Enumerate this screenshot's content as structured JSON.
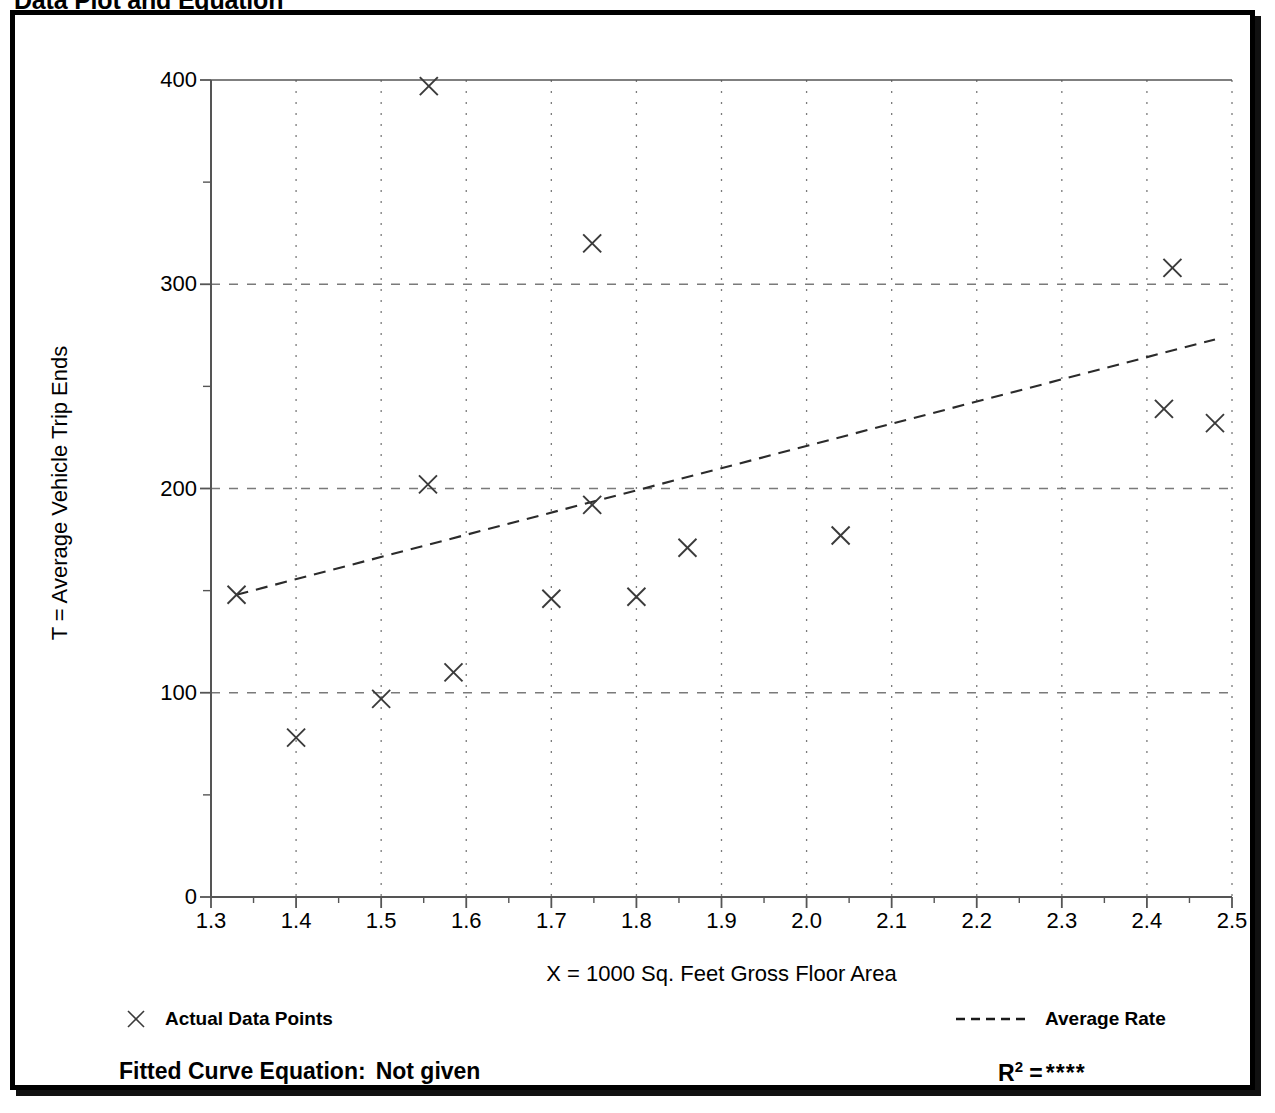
{
  "page_title": "Data Plot and Equation",
  "chart_data": {
    "type": "scatter",
    "title": "Data Plot and Equation",
    "xlabel": "X = 1000 Sq. Feet Gross Floor Area",
    "ylabel": "T = Average Vehicle Trip Ends",
    "xlim": [
      1.3,
      2.5
    ],
    "ylim": [
      0,
      400
    ],
    "xticks": [
      "1.3",
      "1.4",
      "1.5",
      "1.6",
      "1.7",
      "1.8",
      "1.9",
      "2.0",
      "2.1",
      "2.2",
      "2.3",
      "2.4",
      "2.5"
    ],
    "yticks": [
      "0",
      "100",
      "200",
      "300",
      "400"
    ],
    "x_minor_tick_step": 0.05,
    "y_minor_tick_step": 50,
    "grid": true,
    "grid_style": "dotted",
    "legend_position": "below-axes",
    "series": [
      {
        "name": "Actual Data Points",
        "marker": "x",
        "points": [
          {
            "x": 1.33,
            "y": 148
          },
          {
            "x": 1.4,
            "y": 78
          },
          {
            "x": 1.5,
            "y": 97
          },
          {
            "x": 1.556,
            "y": 397
          },
          {
            "x": 1.555,
            "y": 202
          },
          {
            "x": 1.585,
            "y": 110
          },
          {
            "x": 1.7,
            "y": 146
          },
          {
            "x": 1.748,
            "y": 320
          },
          {
            "x": 1.748,
            "y": 192
          },
          {
            "x": 1.8,
            "y": 147
          },
          {
            "x": 1.86,
            "y": 171
          },
          {
            "x": 2.04,
            "y": 177
          },
          {
            "x": 2.43,
            "y": 308
          },
          {
            "x": 2.42,
            "y": 239
          },
          {
            "x": 2.48,
            "y": 232
          }
        ]
      },
      {
        "name": "Average Rate",
        "marker": "dashed-line",
        "line": [
          {
            "x": 1.33,
            "y": 148
          },
          {
            "x": 2.48,
            "y": 273
          }
        ]
      }
    ],
    "annotations": {
      "fitted_curve_equation_label": "Fitted Curve Equation:",
      "fitted_curve_equation_value": "Not given",
      "r_squared_label": "R",
      "r_squared_exponent": "2",
      "r_squared_equals": "=",
      "r_squared_value": "****"
    }
  },
  "legend": {
    "data_points_label": "Actual Data Points",
    "average_rate_label": "Average Rate",
    "data_points_icon": "x-marker-icon",
    "average_rate_icon": "dashed-line-icon"
  },
  "colors": {
    "foreground": "#000000",
    "marker": "#3a3a3a",
    "grid": "#7a7a7a",
    "axis": "#555555",
    "background": "#ffffff"
  }
}
